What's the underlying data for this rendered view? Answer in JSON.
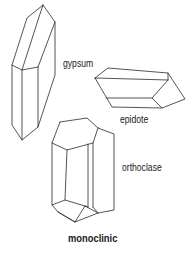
{
  "diagram": {
    "caption": "monoclinic",
    "crystals": [
      {
        "name": "gypsum",
        "label": "gypsum"
      },
      {
        "name": "epidote",
        "label": "epidote"
      },
      {
        "name": "orthoclase",
        "label": "orthoclase"
      }
    ],
    "line_color": "#2a2a2a",
    "background": "#ffffff"
  }
}
